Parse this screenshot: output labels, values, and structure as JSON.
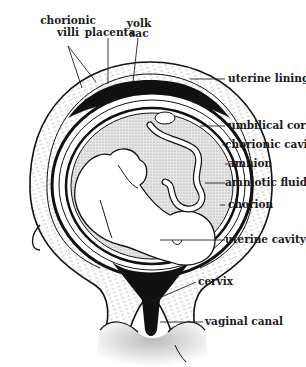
{
  "diagram": {
    "colors": {
      "ink": "#111111",
      "fill_light": "#f4f4f4",
      "stipple": "#bdbdbd",
      "background": "#ffffff"
    },
    "labels": {
      "chorionic_villi_1": "chorionic",
      "chorionic_villi_2": "villi",
      "placenta": "placenta",
      "yolk_sac_1": "yolk",
      "yolk_sac_2": "sac",
      "uterine_lining": "uterine lining",
      "umbilical_cord": "umbilical cord",
      "chorionic_cavity": "chorionic cavity",
      "amnion": "amnion",
      "amniotic_fluid": "amniotic fluid",
      "chorion": "chorion",
      "uterine_cavity": "uterine cavity",
      "cervix": "cervix",
      "vaginal_canal": "vaginal canal"
    }
  }
}
